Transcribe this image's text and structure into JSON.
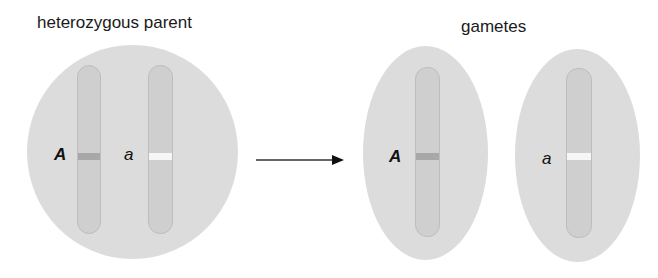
{
  "diagram": {
    "parent": {
      "title": "heterozygous parent",
      "shape": "circle",
      "alleles": [
        {
          "label": "A",
          "band_color": "#a8a8a8",
          "bold": true
        },
        {
          "label": "a",
          "band_color": "#f6f6f6",
          "bold": false
        }
      ]
    },
    "arrow": {
      "direction": "right"
    },
    "gametes": {
      "title": "gametes",
      "items": [
        {
          "label": "A",
          "band_color": "#a8a8a8",
          "bold": true
        },
        {
          "label": "a",
          "band_color": "#f6f6f6",
          "bold": false
        }
      ]
    },
    "colors": {
      "cell": "#dcdcdc",
      "chromosome": "#cfcfcf",
      "dominant_band": "#a8a8a8",
      "recessive_band": "#f6f6f6",
      "text": "#111111"
    }
  }
}
